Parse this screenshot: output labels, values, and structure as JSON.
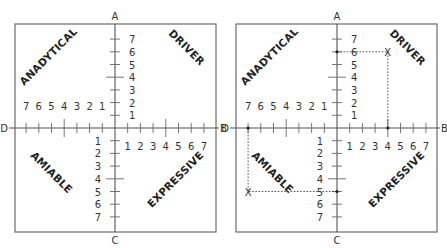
{
  "diagram": {
    "axes": {
      "top": "A",
      "right": "B",
      "bottom": "C",
      "left": "D"
    },
    "scale": [
      1,
      2,
      3,
      4,
      5,
      6,
      7
    ],
    "quadrants": {
      "top_left": "ANADYTICAL",
      "top_right": "DRIVER",
      "bottom_left": "AMIABLE",
      "bottom_right": "EXPRESSIVE"
    },
    "panels": [
      {
        "id": "blank",
        "box": {
          "x": 15,
          "y": 24,
          "w": 201,
          "h": 208
        },
        "origin": {
          "x": 115,
          "y": 128
        },
        "plots": []
      },
      {
        "id": "plotted",
        "box": {
          "x": 236,
          "y": 24,
          "w": 201,
          "h": 208
        },
        "origin": {
          "x": 337,
          "y": 128
        },
        "plots": [
          {
            "quadrant": "DRIVER",
            "axis_value_vertical": "A6",
            "axis_value_horizontal": "B4",
            "mark": "X"
          },
          {
            "quadrant": "AMIABLE",
            "axis_value_vertical": "C5",
            "axis_value_horizontal": "D7",
            "mark": "X"
          }
        ]
      }
    ],
    "step_px": 12.7,
    "colors": {
      "line": "#555555",
      "text": "#222222",
      "background": "#ffffff"
    }
  }
}
